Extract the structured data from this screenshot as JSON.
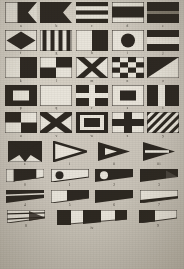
{
  "plate": {
    "title": "International Code of Signals — Flags and Pennants",
    "medium": "monochrome engraved plate",
    "paper_color": "#cdc8be",
    "ink_color": "#241f19",
    "field_color": "#e8e4da"
  },
  "legend": {
    "dark_label": "dark (red/blue/black in colour)",
    "light_label": "light (white/yellow in colour)"
  },
  "rows": [
    {
      "row_name": "letters-a-e",
      "cells": [
        {
          "label": "a",
          "flag_name": "alpha",
          "shape": "swallowtail",
          "pattern": "vertical-half",
          "bands": [
            "light",
            "dark"
          ]
        },
        {
          "label": "b",
          "flag_name": "bravo",
          "shape": "swallowtail",
          "pattern": "solid",
          "bands": [
            "dark"
          ]
        },
        {
          "label": "c",
          "flag_name": "charlie",
          "shape": "rect",
          "pattern": "horizontal-stripes-5",
          "bands": [
            "dark",
            "light",
            "dark",
            "light",
            "dark"
          ]
        },
        {
          "label": "d",
          "flag_name": "delta",
          "shape": "rect",
          "pattern": "horizontal-stripes-3",
          "bands": [
            "light",
            "dark",
            "light"
          ]
        },
        {
          "label": "e",
          "flag_name": "echo",
          "shape": "rect",
          "pattern": "horizontal-half",
          "bands": [
            "dark",
            "dark"
          ]
        }
      ]
    },
    {
      "row_name": "letters-f-j",
      "cells": [
        {
          "label": "f",
          "flag_name": "foxtrot",
          "shape": "rect",
          "pattern": "diamond",
          "bands": [
            "light",
            "dark"
          ]
        },
        {
          "label": "g",
          "flag_name": "golf",
          "shape": "rect",
          "pattern": "vertical-stripes-6",
          "bands": [
            "light",
            "dark",
            "light",
            "dark",
            "light",
            "dark"
          ]
        },
        {
          "label": "h",
          "flag_name": "hotel",
          "shape": "rect",
          "pattern": "vertical-half",
          "bands": [
            "light",
            "dark"
          ]
        },
        {
          "label": "i",
          "flag_name": "india",
          "shape": "rect",
          "pattern": "circle",
          "bands": [
            "light",
            "dark"
          ]
        },
        {
          "label": "j",
          "flag_name": "juliett",
          "shape": "rect",
          "pattern": "horizontal-stripes-3",
          "bands": [
            "dark",
            "light",
            "dark"
          ]
        }
      ]
    },
    {
      "row_name": "letters-k-o",
      "cells": [
        {
          "label": "k",
          "flag_name": "kilo",
          "shape": "rect",
          "pattern": "vertical-half",
          "bands": [
            "light",
            "dark"
          ]
        },
        {
          "label": "l",
          "flag_name": "lima",
          "shape": "rect",
          "pattern": "quartered",
          "bands": [
            "light",
            "dark",
            "dark",
            "light"
          ]
        },
        {
          "label": "m",
          "flag_name": "mike",
          "shape": "rect",
          "pattern": "saltire",
          "bands": [
            "dark",
            "light"
          ]
        },
        {
          "label": "n",
          "flag_name": "november",
          "shape": "rect",
          "pattern": "checker-4x4",
          "bands": [
            "light",
            "dark"
          ]
        },
        {
          "label": "o",
          "flag_name": "oscar",
          "shape": "rect",
          "pattern": "diagonal-half",
          "bands": [
            "dark",
            "light"
          ]
        }
      ]
    },
    {
      "row_name": "letters-p-t",
      "cells": [
        {
          "label": "p",
          "flag_name": "papa",
          "shape": "rect",
          "pattern": "center-rect",
          "bands": [
            "dark",
            "light"
          ]
        },
        {
          "label": "q",
          "flag_name": "quebec",
          "shape": "rect",
          "pattern": "solid",
          "bands": [
            "light"
          ]
        },
        {
          "label": "r",
          "flag_name": "romeo",
          "shape": "rect",
          "pattern": "cross",
          "bands": [
            "dark",
            "light"
          ]
        },
        {
          "label": "s",
          "flag_name": "sierra",
          "shape": "rect",
          "pattern": "center-rect",
          "bands": [
            "light",
            "dark"
          ]
        },
        {
          "label": "t",
          "flag_name": "tango",
          "shape": "rect",
          "pattern": "vertical-stripes-3",
          "bands": [
            "dark",
            "light",
            "dark"
          ]
        }
      ]
    },
    {
      "row_name": "letters-u-y",
      "cells": [
        {
          "label": "u",
          "flag_name": "uniform",
          "shape": "rect",
          "pattern": "quartered",
          "bands": [
            "dark",
            "light",
            "light",
            "dark"
          ]
        },
        {
          "label": "v",
          "flag_name": "victor",
          "shape": "rect",
          "pattern": "saltire",
          "bands": [
            "light",
            "dark"
          ]
        },
        {
          "label": "w",
          "flag_name": "whiskey",
          "shape": "rect",
          "pattern": "nested-rects",
          "bands": [
            "dark",
            "light",
            "dark"
          ]
        },
        {
          "label": "x",
          "flag_name": "xray",
          "shape": "rect",
          "pattern": "cross",
          "bands": [
            "light",
            "dark"
          ]
        },
        {
          "label": "y",
          "flag_name": "yankee",
          "shape": "rect",
          "pattern": "diagonal-stripes",
          "bands": [
            "light",
            "dark"
          ]
        }
      ]
    },
    {
      "row_name": "letter-z-and-pennants-1-3",
      "cells": [
        {
          "label": "z",
          "flag_name": "zulu",
          "shape": "rect",
          "pattern": "quarter-triangles",
          "bands": [
            "dark",
            "light"
          ]
        },
        {
          "label": "i",
          "flag_name": "pennant-one",
          "shape": "pennant-triangle",
          "pattern": "outline",
          "bands": [
            "light",
            "dark"
          ]
        },
        {
          "label": "ii",
          "flag_name": "pennant-two",
          "shape": "pennant-triangle",
          "pattern": "inner-triangle",
          "bands": [
            "dark",
            "light"
          ]
        },
        {
          "label": "iii",
          "flag_name": "pennant-three",
          "shape": "pennant-triangle",
          "pattern": "horizontal-band",
          "bands": [
            "dark",
            "light",
            "dark"
          ]
        }
      ]
    },
    {
      "row_name": "numerals-0-3",
      "cells": [
        {
          "label": "0",
          "flag_name": "numeral-zero",
          "shape": "taper-pennant",
          "pattern": "hoist-block",
          "bands": [
            "light",
            "dark",
            "light"
          ]
        },
        {
          "label": "1",
          "flag_name": "numeral-one",
          "shape": "taper-pennant",
          "pattern": "disc-dark-on-light",
          "bands": [
            "light",
            "dark"
          ]
        },
        {
          "label": "2",
          "flag_name": "numeral-two",
          "shape": "taper-pennant",
          "pattern": "disc-light-on-dark",
          "bands": [
            "dark",
            "light"
          ]
        },
        {
          "label": "3",
          "flag_name": "numeral-three",
          "shape": "taper-pennant",
          "pattern": "solid-dark",
          "bands": [
            "dark"
          ]
        }
      ]
    },
    {
      "row_name": "numerals-4-7",
      "cells": [
        {
          "label": "4",
          "flag_name": "numeral-four",
          "shape": "taper-pennant",
          "pattern": "horizontal-stripes-3",
          "bands": [
            "dark",
            "light",
            "dark"
          ]
        },
        {
          "label": "5",
          "flag_name": "numeral-five",
          "shape": "taper-pennant",
          "pattern": "hoist-light-fly-dark",
          "bands": [
            "light",
            "dark"
          ]
        },
        {
          "label": "6",
          "flag_name": "numeral-six",
          "shape": "taper-pennant",
          "pattern": "solid-dark",
          "bands": [
            "dark"
          ]
        },
        {
          "label": "7",
          "flag_name": "numeral-seven",
          "shape": "taper-pennant",
          "pattern": "diagonal-split",
          "bands": [
            "light",
            "dark"
          ]
        }
      ]
    },
    {
      "row_name": "numerals-8-9-and-answering",
      "cells": [
        {
          "label": "8",
          "flag_name": "numeral-eight",
          "shape": "taper-pennant",
          "pattern": "horizontal-stripes-3",
          "bands": [
            "light",
            "dark",
            "light"
          ]
        },
        {
          "label": "iv",
          "flag_name": "answering-pennant",
          "shape": "long-pennant",
          "pattern": "vertical-bands-5",
          "bands": [
            "dark",
            "light",
            "dark",
            "light",
            "dark"
          ]
        },
        {
          "label": "9",
          "flag_name": "numeral-nine",
          "shape": "taper-pennant",
          "pattern": "hoist-dark-fly-light",
          "bands": [
            "dark",
            "light"
          ]
        }
      ]
    }
  ]
}
